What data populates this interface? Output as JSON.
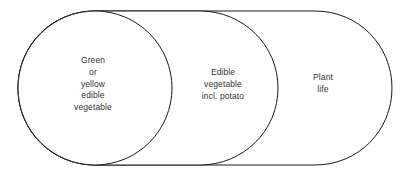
{
  "diagram": {
    "type": "venn-nested",
    "background_color": "#ffffff",
    "stroke_color": "#1a1a1a",
    "text_color": "#333333",
    "regions": [
      {
        "id": "inner",
        "name": "green-or-yellow-edible-vegetable",
        "label": "Green\nor\nyellow\nedible\nvegetable",
        "lines": [
          "Green",
          "or",
          "yellow",
          "edible",
          "vegetable"
        ]
      },
      {
        "id": "middle",
        "name": "edible-vegetable-incl-potato",
        "label": "Edible\nvegetable\nincl. potato",
        "lines": [
          "Edible",
          "vegetable",
          "incl. potato"
        ]
      },
      {
        "id": "outer",
        "name": "plant-life",
        "label": "Plant\nlife",
        "lines": [
          "Plant",
          "life"
        ]
      }
    ]
  }
}
